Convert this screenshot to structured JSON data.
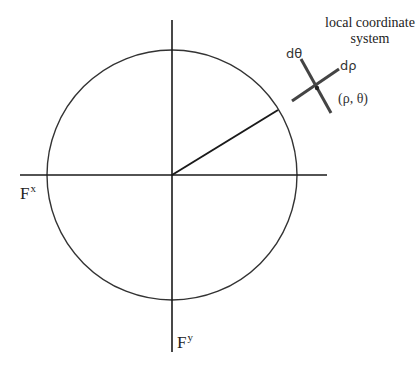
{
  "diagram": {
    "caption": {
      "line1": "local coordinate",
      "line2": "system"
    },
    "axes": {
      "x_label_base": "F",
      "x_label_sup": "x",
      "y_label_base": "F",
      "y_label_sup": "y"
    },
    "local_frame": {
      "theta_label": "dθ",
      "rho_label": "dρ",
      "point_label": "(ρ, θ)"
    },
    "colors": {
      "line": "#1a1a1a",
      "circle": "#333333",
      "frame": "#444444",
      "text": "#222222",
      "background": "#ffffff"
    }
  }
}
